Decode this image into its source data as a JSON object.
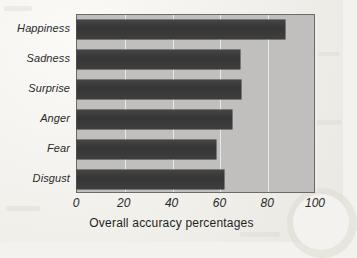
{
  "chart_data": {
    "type": "bar",
    "orientation": "horizontal",
    "title": "",
    "xlabel": "Overall accuracy percentages",
    "ylabel": "",
    "categories": [
      "Happiness",
      "Sadness",
      "Surprise",
      "Anger",
      "Fear",
      "Disgust"
    ],
    "values": [
      87,
      68,
      68.5,
      65,
      58,
      61.5
    ],
    "xlim": [
      0,
      100
    ],
    "xticks": [
      0,
      20,
      40,
      60,
      80,
      100
    ],
    "xtick_labels": [
      "0",
      "20",
      "40",
      "60",
      "80",
      "100"
    ],
    "grid": true,
    "grid_axis": "x",
    "legend": false,
    "bar_color": "#3a3a3a",
    "plot_background": "#c0bfbd",
    "gridline_color": "#eeeeec",
    "axis_border_color": "#6c6b69",
    "page_background": "#f1efea"
  },
  "axis": {
    "x_title": "Overall accuracy percentages"
  }
}
